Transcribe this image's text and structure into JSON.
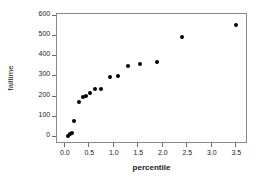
{
  "chart_data": {
    "type": "scatter",
    "title": "",
    "xlabel": "percentile",
    "ylabel": "failtime",
    "xlim": [
      -0.18,
      3.72
    ],
    "ylim": [
      -30,
      615
    ],
    "grid": false,
    "legend": null,
    "marker": {
      "shape": "filled-circle",
      "color": "#000000",
      "size": 4
    },
    "xticks": [
      "0.0",
      "0.5",
      "1.0",
      "1.5",
      "2.0",
      "2.5",
      "3.0",
      "3.5"
    ],
    "xtick_values": [
      0.0,
      0.5,
      1.0,
      1.5,
      2.0,
      2.5,
      3.0,
      3.5
    ],
    "yticks": [
      "0",
      "100",
      "200",
      "300",
      "400",
      "500",
      "600"
    ],
    "ytick_values": [
      0,
      100,
      200,
      300,
      400,
      500,
      600
    ],
    "points": [
      {
        "x": 0.05,
        "y": 10
      },
      {
        "x": 0.08,
        "y": 18
      },
      {
        "x": 0.12,
        "y": 26
      },
      {
        "x": 0.17,
        "y": 82
      },
      {
        "x": 0.27,
        "y": 180
      },
      {
        "x": 0.35,
        "y": 205
      },
      {
        "x": 0.41,
        "y": 210
      },
      {
        "x": 0.5,
        "y": 225
      },
      {
        "x": 0.6,
        "y": 242
      },
      {
        "x": 0.72,
        "y": 245
      },
      {
        "x": 0.91,
        "y": 303
      },
      {
        "x": 1.06,
        "y": 306
      },
      {
        "x": 1.27,
        "y": 358
      },
      {
        "x": 1.52,
        "y": 365
      },
      {
        "x": 1.86,
        "y": 378
      },
      {
        "x": 2.37,
        "y": 502
      },
      {
        "x": 3.47,
        "y": 560
      }
    ]
  },
  "axes": {
    "x_title": "percentile",
    "y_title": "failtime"
  }
}
